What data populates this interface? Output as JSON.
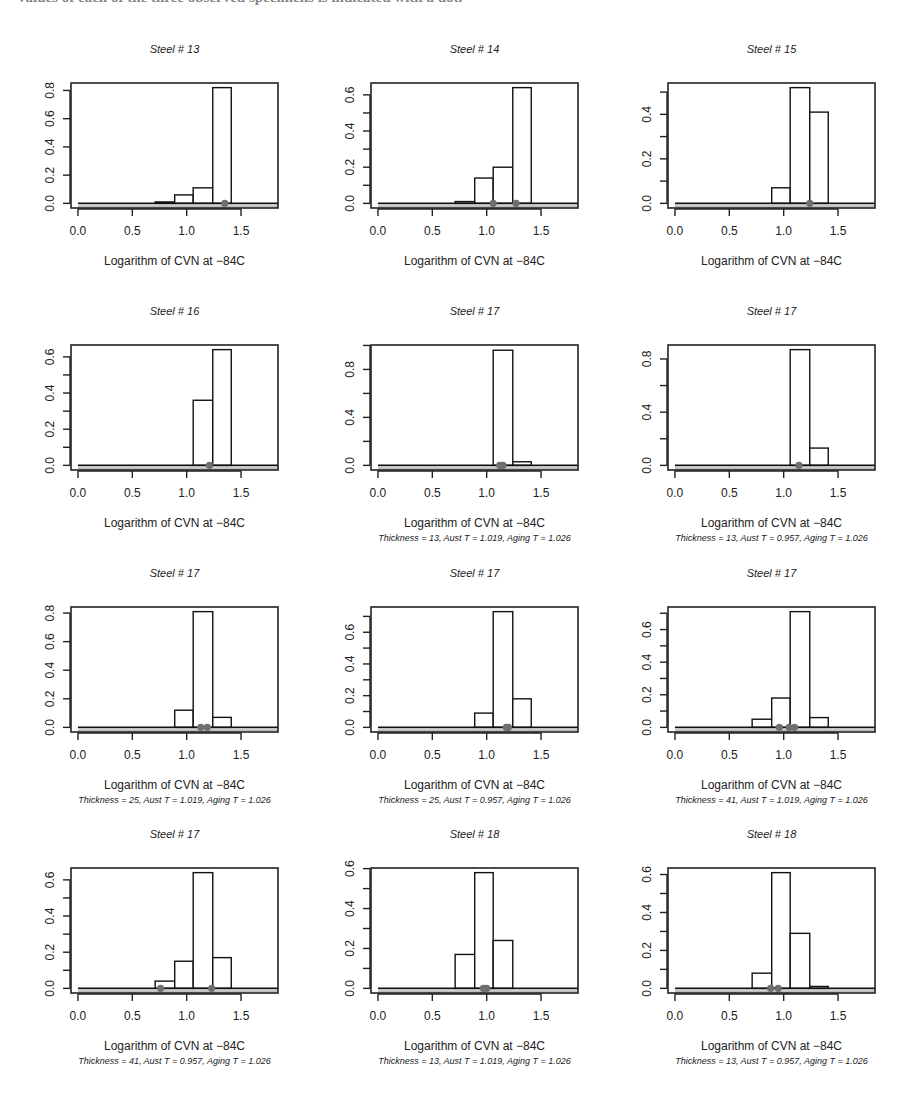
{
  "page": {
    "header_fragment": "values of each of the three observed specimens is indicated with a dot."
  },
  "chart_data": [
    {
      "type": "bar",
      "title": "Steel # 13",
      "xlabel": "Logarithm of CVN at −84C",
      "subtitle": "",
      "bin_edges": [
        0.71,
        0.89,
        1.06,
        1.24,
        1.41
      ],
      "values": [
        0.01,
        0.06,
        0.11,
        0.82
      ],
      "observed_points": [
        1.35
      ],
      "xticks": [
        0,
        0.5,
        1.0,
        1.5
      ],
      "xtick_labels": [
        "0.0",
        "0.5",
        "1.0",
        "1.5"
      ],
      "yticks": [
        0,
        0.2,
        0.4,
        0.6,
        0.8
      ],
      "ytick_labels": [
        "0.0",
        "0.2",
        "0.4",
        "0.6",
        "0.8"
      ],
      "ylim": [
        0,
        0.82
      ],
      "xlim": [
        0,
        1.8
      ],
      "grid": false
    },
    {
      "type": "bar",
      "title": "Steel # 14",
      "xlabel": "Logarithm of CVN at −84C",
      "subtitle": "",
      "bin_edges": [
        0.71,
        0.89,
        1.06,
        1.24,
        1.41
      ],
      "values": [
        0.01,
        0.14,
        0.2,
        0.64
      ],
      "observed_points": [
        1.06,
        1.27
      ],
      "xticks": [
        0,
        0.5,
        1.0,
        1.5
      ],
      "xtick_labels": [
        "0.0",
        "0.5",
        "1.0",
        "1.5"
      ],
      "yticks": [
        0,
        0.1,
        0.2,
        0.3,
        0.4,
        0.5,
        0.6
      ],
      "ytick_labels": [
        "0.0",
        "",
        "0.2",
        "",
        "0.4",
        "",
        "0.6"
      ],
      "ylim": [
        0,
        0.64
      ],
      "xlim": [
        0,
        1.8
      ],
      "grid": false
    },
    {
      "type": "bar",
      "title": "Steel # 15",
      "xlabel": "Logarithm of CVN at −84C",
      "subtitle": "",
      "bin_edges": [
        0.71,
        0.89,
        1.06,
        1.24,
        1.41
      ],
      "values": [
        0,
        0.07,
        0.52,
        0.41
      ],
      "observed_points": [
        1.24
      ],
      "xticks": [
        0,
        0.5,
        1.0,
        1.5
      ],
      "xtick_labels": [
        "0.0",
        "0.5",
        "1.0",
        "1.5"
      ],
      "yticks": [
        0,
        0.1,
        0.2,
        0.3,
        0.4,
        0.5
      ],
      "ytick_labels": [
        "0.0",
        "",
        "0.2",
        "",
        "0.4",
        ""
      ],
      "ylim": [
        0,
        0.52
      ],
      "xlim": [
        0,
        1.8
      ],
      "grid": false
    },
    {
      "type": "bar",
      "title": "Steel # 16",
      "xlabel": "Logarithm of CVN at −84C",
      "subtitle": "",
      "bin_edges": [
        0.71,
        0.89,
        1.06,
        1.24,
        1.41
      ],
      "values": [
        0,
        0,
        0.36,
        0.64
      ],
      "observed_points": [
        1.21
      ],
      "xticks": [
        0,
        0.5,
        1.0,
        1.5
      ],
      "xtick_labels": [
        "0.0",
        "0.5",
        "1.0",
        "1.5"
      ],
      "yticks": [
        0,
        0.1,
        0.2,
        0.3,
        0.4,
        0.5,
        0.6
      ],
      "ytick_labels": [
        "0.0",
        "",
        "0.2",
        "",
        "0.4",
        "",
        "0.6"
      ],
      "ylim": [
        0,
        0.64
      ],
      "xlim": [
        0,
        1.8
      ],
      "grid": false
    },
    {
      "type": "bar",
      "title": "Steel # 17",
      "xlabel": "Logarithm of CVN at −84C",
      "subtitle": "Thickness = 13, Aust T = 1.019, Aging T = 1.026",
      "bin_edges": [
        0.71,
        0.89,
        1.06,
        1.24,
        1.41
      ],
      "values": [
        0,
        0,
        0.96,
        0.03
      ],
      "observed_points": [
        1.12,
        1.15
      ],
      "xticks": [
        0,
        0.5,
        1.0,
        1.5
      ],
      "xtick_labels": [
        "0.0",
        "0.5",
        "1.0",
        "1.5"
      ],
      "yticks": [
        0,
        0.2,
        0.4,
        0.6,
        0.8,
        1.0
      ],
      "ytick_labels": [
        "0.0",
        "",
        "0.4",
        "",
        "0.8",
        ""
      ],
      "ylim": [
        0,
        0.965
      ],
      "xlim": [
        0,
        1.8
      ],
      "grid": false
    },
    {
      "type": "bar",
      "title": "Steel # 17",
      "xlabel": "Logarithm of CVN at −84C",
      "subtitle": "Thickness = 13, Aust T = 0.957, Aging T = 1.026",
      "bin_edges": [
        0.71,
        0.89,
        1.06,
        1.24,
        1.41
      ],
      "values": [
        0,
        0,
        0.87,
        0.13
      ],
      "observed_points": [
        1.14
      ],
      "xticks": [
        0,
        0.5,
        1.0,
        1.5
      ],
      "xtick_labels": [
        "0.0",
        "0.5",
        "1.0",
        "1.5"
      ],
      "yticks": [
        0,
        0.2,
        0.4,
        0.6,
        0.8
      ],
      "ytick_labels": [
        "0.0",
        "",
        "0.4",
        "",
        "0.8"
      ],
      "ylim": [
        0,
        0.87
      ],
      "xlim": [
        0,
        1.8
      ],
      "grid": false
    },
    {
      "type": "bar",
      "title": "Steel # 17",
      "xlabel": "Logarithm of CVN at −84C",
      "subtitle": "Thickness = 25, Aust T = 1.019, Aging T = 1.026",
      "bin_edges": [
        0.71,
        0.89,
        1.06,
        1.24,
        1.41
      ],
      "values": [
        0,
        0.12,
        0.81,
        0.07
      ],
      "observed_points": [
        1.13,
        1.19
      ],
      "xticks": [
        0,
        0.5,
        1.0,
        1.5
      ],
      "xtick_labels": [
        "0.0",
        "0.5",
        "1.0",
        "1.5"
      ],
      "yticks": [
        0,
        0.2,
        0.4,
        0.6,
        0.8
      ],
      "ytick_labels": [
        "0.0",
        "0.2",
        "0.4",
        "0.6",
        "0.8"
      ],
      "ylim": [
        0,
        0.81
      ],
      "xlim": [
        0,
        1.8
      ],
      "grid": false
    },
    {
      "type": "bar",
      "title": "Steel # 17",
      "xlabel": "Logarithm of CVN at −84C",
      "subtitle": "Thickness = 25, Aust T = 0.957, Aging T = 1.026",
      "bin_edges": [
        0.71,
        0.89,
        1.06,
        1.24,
        1.41
      ],
      "values": [
        0,
        0.09,
        0.73,
        0.18
      ],
      "observed_points": [
        1.18,
        1.2
      ],
      "xticks": [
        0,
        0.5,
        1.0,
        1.5
      ],
      "xtick_labels": [
        "0.0",
        "0.5",
        "1.0",
        "1.5"
      ],
      "yticks": [
        0,
        0.1,
        0.2,
        0.3,
        0.4,
        0.5,
        0.6,
        0.7
      ],
      "ytick_labels": [
        "0.0",
        "",
        "0.2",
        "",
        "0.4",
        "",
        "0.6",
        ""
      ],
      "ylim": [
        0,
        0.73
      ],
      "xlim": [
        0,
        1.8
      ],
      "grid": false
    },
    {
      "type": "bar",
      "title": "Steel # 17",
      "xlabel": "Logarithm of CVN at −84C",
      "subtitle": "Thickness = 41, Aust T = 1.019, Aging T = 1.026",
      "bin_edges": [
        0.71,
        0.89,
        1.06,
        1.24,
        1.41
      ],
      "values": [
        0.05,
        0.18,
        0.71,
        0.06
      ],
      "observed_points": [
        0.96,
        1.05,
        1.1
      ],
      "xticks": [
        0,
        0.5,
        1.0,
        1.5
      ],
      "xtick_labels": [
        "0.0",
        "0.5",
        "1.0",
        "1.5"
      ],
      "yticks": [
        0,
        0.1,
        0.2,
        0.3,
        0.4,
        0.5,
        0.6,
        0.7
      ],
      "ytick_labels": [
        "0.0",
        "",
        "0.2",
        "",
        "0.4",
        "",
        "0.6",
        ""
      ],
      "ylim": [
        0,
        0.71
      ],
      "xlim": [
        0,
        1.8
      ],
      "grid": false
    },
    {
      "type": "bar",
      "title": "Steel # 17",
      "xlabel": "Logarithm of CVN at −84C",
      "subtitle": "Thickness = 41, Aust T = 0.957, Aging T = 1.026",
      "bin_edges": [
        0.71,
        0.89,
        1.06,
        1.24,
        1.41
      ],
      "values": [
        0.04,
        0.15,
        0.64,
        0.17
      ],
      "observed_points": [
        0.76,
        1.23
      ],
      "xticks": [
        0,
        0.5,
        1.0,
        1.5
      ],
      "xtick_labels": [
        "0.0",
        "0.5",
        "1.0",
        "1.5"
      ],
      "yticks": [
        0,
        0.1,
        0.2,
        0.3,
        0.4,
        0.5,
        0.6
      ],
      "ytick_labels": [
        "0.0",
        "",
        "0.2",
        "",
        "0.4",
        "",
        "0.6"
      ],
      "ylim": [
        0,
        0.64
      ],
      "xlim": [
        0,
        1.8
      ],
      "grid": false
    },
    {
      "type": "bar",
      "title": "Steel # 18",
      "xlabel": "Logarithm of CVN at −84C",
      "subtitle": "Thickness = 13, Aust T = 1.019, Aging T = 1.026",
      "bin_edges": [
        0.71,
        0.89,
        1.06,
        1.24,
        1.41
      ],
      "values": [
        0.17,
        0.58,
        0.24,
        0
      ],
      "observed_points": [
        0.97,
        1.0
      ],
      "xticks": [
        0,
        0.5,
        1.0,
        1.5
      ],
      "xtick_labels": [
        "0.0",
        "0.5",
        "1.0",
        "1.5"
      ],
      "yticks": [
        0,
        0.1,
        0.2,
        0.3,
        0.4,
        0.5,
        0.6
      ],
      "ytick_labels": [
        "0.0",
        "",
        "0.2",
        "",
        "0.4",
        "",
        "0.6"
      ],
      "ylim": [
        0,
        0.58
      ],
      "xlim": [
        0,
        1.8
      ],
      "grid": false
    },
    {
      "type": "bar",
      "title": "Steel # 18",
      "xlabel": "Logarithm of CVN at −84C",
      "subtitle": "Thickness = 13, Aust T = 0.957, Aging T = 1.026",
      "bin_edges": [
        0.71,
        0.89,
        1.06,
        1.24,
        1.41
      ],
      "values": [
        0.08,
        0.61,
        0.29,
        0.01
      ],
      "observed_points": [
        0.88,
        0.95
      ],
      "xticks": [
        0,
        0.5,
        1.0,
        1.5
      ],
      "xtick_labels": [
        "0.0",
        "0.5",
        "1.0",
        "1.5"
      ],
      "yticks": [
        0,
        0.1,
        0.2,
        0.3,
        0.4,
        0.5,
        0.6
      ],
      "ytick_labels": [
        "0.0",
        "",
        "0.2",
        "",
        "0.4",
        "",
        "0.6"
      ],
      "ylim": [
        0,
        0.61
      ],
      "xlim": [
        0,
        1.8
      ],
      "grid": false
    }
  ]
}
